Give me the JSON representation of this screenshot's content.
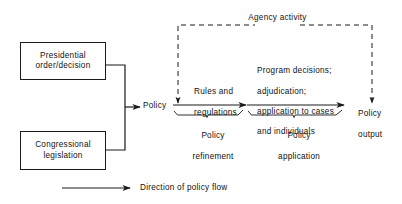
{
  "figure": {
    "type": "flow-diagram",
    "background_color": "#ffffff",
    "line_color": "#1a1a1a",
    "text_color": "#111111"
  },
  "boxes": [
    {
      "id": "presidential-order",
      "line1": "Presidential",
      "line2": "order/decision"
    },
    {
      "id": "congressional-legislation",
      "line1": "Congressional",
      "line2": "legislation"
    }
  ],
  "nodes": {
    "policy": "Policy",
    "policy_output_line1": "Policy",
    "policy_output_line2": "output"
  },
  "stages": [
    {
      "id": "policy-refinement",
      "arrow_label_line1": "Rules and",
      "arrow_label_line2": "regulations",
      "brace_label_line1": "Policy",
      "brace_label_line2": "refinement"
    },
    {
      "id": "policy-application",
      "arrow_label_line1": "Program decisions;",
      "arrow_label_line2": "adjudication;",
      "arrow_label_line3": "application to cases",
      "arrow_label_line4": "and individuals",
      "brace_label_line1": "Policy",
      "brace_label_line2": "application"
    }
  ],
  "feedback": {
    "label": "Agency activity",
    "style": "dashed"
  },
  "legend": {
    "label": "Direction of policy flow"
  }
}
